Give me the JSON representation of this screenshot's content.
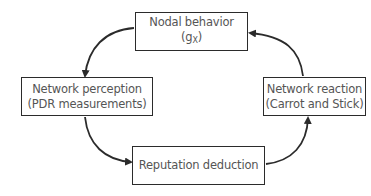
{
  "diagram": {
    "type": "cycle",
    "nodes": [
      {
        "id": "nodal",
        "line1": "Nodal behavior",
        "line2_main": "(g",
        "line2_sub": "X",
        "line2_end": ")"
      },
      {
        "id": "perception",
        "line1": "Network perception",
        "line2": "(PDR measurements)"
      },
      {
        "id": "reputation",
        "line1": "Reputation deduction"
      },
      {
        "id": "reaction",
        "line1": "Network reaction",
        "line2": "(Carrot and Stick)"
      }
    ],
    "edges": [
      {
        "from": "nodal",
        "to": "perception"
      },
      {
        "from": "perception",
        "to": "reputation"
      },
      {
        "from": "reputation",
        "to": "reaction"
      },
      {
        "from": "reaction",
        "to": "nodal"
      }
    ],
    "colors": {
      "stroke": "#2b2b2b",
      "text": "#555555",
      "background": "#ffffff"
    }
  }
}
